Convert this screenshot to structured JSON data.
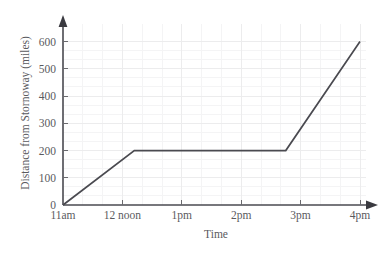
{
  "chart_data": {
    "type": "line",
    "title": "",
    "xlabel": "Time",
    "ylabel": "Distance from Stornoway (miles)",
    "x_tick_labels": [
      "11am",
      "12 noon",
      "1pm",
      "2pm",
      "3pm",
      "4pm"
    ],
    "x_tick_values": [
      11,
      12,
      13,
      14,
      15,
      16
    ],
    "y_tick_labels": [
      "0",
      "100",
      "200",
      "300",
      "400",
      "500",
      "600"
    ],
    "y_tick_values": [
      0,
      100,
      200,
      300,
      400,
      500,
      600
    ],
    "xlim": [
      11,
      16
    ],
    "ylim": [
      0,
      600
    ],
    "grid": true,
    "grid_minor_divisions": 3,
    "legend": "none",
    "series": [
      {
        "name": "Journey",
        "x": [
          11,
          12.2,
          14.75,
          16
        ],
        "y": [
          0,
          200,
          200,
          600
        ],
        "points": [
          {
            "time": "11am",
            "distance": 0
          },
          {
            "time": "12:12pm",
            "distance": 200
          },
          {
            "time": "2:45pm",
            "distance": 200
          },
          {
            "time": "4pm",
            "distance": 600
          }
        ],
        "color": "#4a4a50"
      }
    ],
    "colors": {
      "line": "#4a4a50",
      "axis": "#4a4a50",
      "grid_major": "#ececed",
      "grid_minor": "#f4f4f5",
      "text": "#5a5a5e",
      "background": "#ffffff"
    }
  }
}
